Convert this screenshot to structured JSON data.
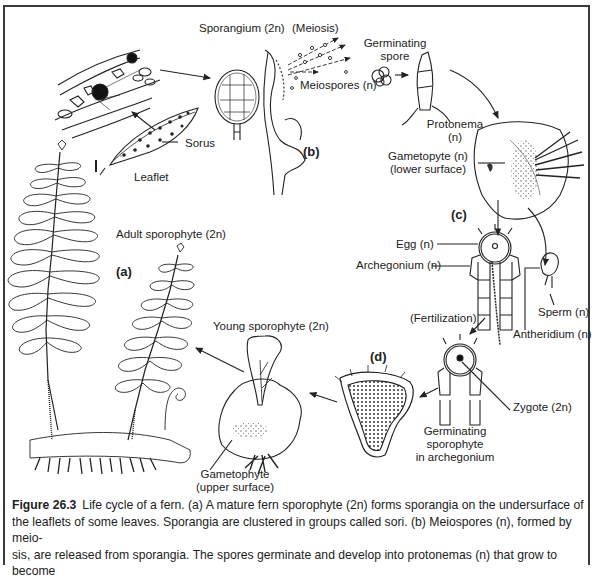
{
  "figure": {
    "number": "Figure 26.3",
    "title": "Life cycle of a fern.",
    "caption_lines": [
      "Life cycle of a fern. (a) A mature fern sporophyte (2n) forms sporangia on the undersurface of",
      "the leaflets of some leaves. Sporangia are clustered in groups called sori. (b) Meiospores (n), formed by meio-",
      "sis, are released from sporangia. The spores germinate and develop into protonemas (n) that grow to become"
    ]
  },
  "panels": {
    "a": "(a)",
    "b": "(b)",
    "c": "(c)",
    "d": "(d)"
  },
  "labels": {
    "sporangium": "Sporangium (2n)",
    "meiosis": "(Meiosis)",
    "germinating_spore_1": "Germinating",
    "germinating_spore_2": "spore",
    "meiospores": "Meiospores (n)",
    "sorus": "Sorus",
    "leaflet": "Leaflet",
    "protonema_1": "Protonema",
    "protonema_2": "(n)",
    "gametophyte_lower_1": "Gametopyte (n)",
    "gametophyte_lower_2": "(lower surface)",
    "adult_sporophyte": "Adult sporophyte (2n)",
    "egg": "Egg (n)",
    "archegonium": "Archegonium (n)",
    "sperm": "Sperm (n)",
    "antheridium": "Antheridium (n)",
    "fertilization": "(Fertilization)",
    "young_sporophyte": "Young sporophyte (2n)",
    "zygote": "Zygote (2n)",
    "germinating_sporophyte_1": "Germinating",
    "germinating_sporophyte_2": "sporophyte",
    "germinating_sporophyte_3": "in archegonium",
    "gametophyte_upper_1": "Gametophyte",
    "gametophyte_upper_2": "(upper surface)"
  },
  "stages": [
    "Adult sporophyte (2n)",
    "Sporangium (2n)",
    "Meiospores (n)",
    "Germinating spore",
    "Protonema (n)",
    "Gametophyte (n)",
    "Egg / Archegonium / Sperm / Antheridium (n)",
    "Zygote (2n)",
    "Germinating sporophyte in archegonium",
    "Young sporophyte (2n)"
  ]
}
